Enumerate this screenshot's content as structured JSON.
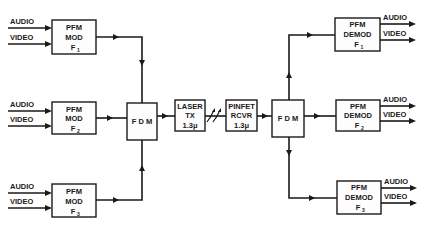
{
  "diagram": {
    "colors": {
      "ink": "#1a1a1a",
      "background": "#ffffff"
    },
    "modulators": [
      {
        "line1": "PFM",
        "line2": "MOD",
        "freq": "F",
        "sub": "1"
      },
      {
        "line1": "PFM",
        "line2": "MOD",
        "freq": "F",
        "sub": "2"
      },
      {
        "line1": "PFM",
        "line2": "MOD",
        "freq": "F",
        "sub": "3"
      }
    ],
    "demodulators": [
      {
        "line1": "PFM",
        "line2": "DEMOD",
        "freq": "F",
        "sub": "1"
      },
      {
        "line1": "PFM",
        "line2": "DEMOD",
        "freq": "F",
        "sub": "2"
      },
      {
        "line1": "PFM",
        "line2": "DEMOD",
        "freq": "F",
        "sub": "3"
      }
    ],
    "signals": {
      "audio": "AUDIO",
      "video": "VIDEO"
    },
    "fdm_tx": {
      "label": "F D M"
    },
    "fdm_rx": {
      "label": "F D M"
    },
    "laser": {
      "line1": "LASER",
      "line2": "TX",
      "line3": "1.3μ"
    },
    "receiver": {
      "line1": "PINFET",
      "line2": "RCVR",
      "line3": "1.3μ"
    }
  }
}
